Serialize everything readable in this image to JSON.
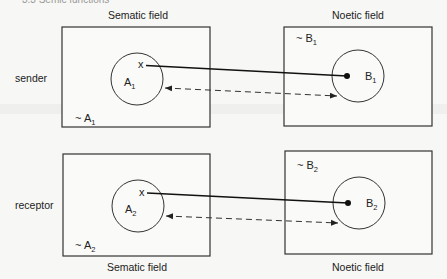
{
  "header": {
    "partial_text": "3.3 Semic functions"
  },
  "columns": {
    "left_title": "Sematic field",
    "right_title": "Noetic field"
  },
  "rows": [
    {
      "role": "sender",
      "left": {
        "circle_label": "A",
        "circle_sub": "1",
        "outside_prefix": "~ ",
        "outside_label": "A",
        "outside_sub": "1",
        "point": "x"
      },
      "right": {
        "circle_label": "B",
        "circle_sub": "1",
        "outside_prefix": "~ ",
        "outside_label": "B",
        "outside_sub": "1"
      }
    },
    {
      "role": "receptor",
      "left": {
        "circle_label": "A",
        "circle_sub": "2",
        "outside_prefix": "~ ",
        "outside_label": "A",
        "outside_sub": "2",
        "point": "x"
      },
      "right": {
        "circle_label": "B",
        "circle_sub": "2",
        "outside_prefix": "~ ",
        "outside_label": "B",
        "outside_sub": "2"
      }
    }
  ],
  "footer": {
    "left_title": "Sematic field",
    "right_title": "Noetic field"
  },
  "colors": {
    "line": "#111111",
    "box_stroke": "#333333",
    "background": "#f7f7f5"
  }
}
